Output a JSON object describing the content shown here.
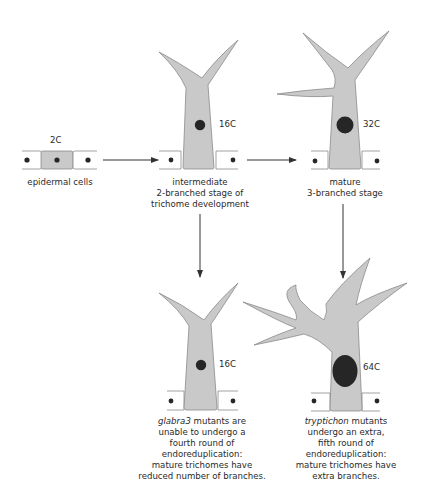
{
  "diagram": {
    "colors": {
      "cell_fill": "#c9c9c9",
      "cell_stroke": "#8a8a8a",
      "epidermal_fill": "#ffffff",
      "nucleus": "#262626",
      "arrow": "#333333"
    },
    "nodes": {
      "epidermal": {
        "ploidy": "2C",
        "caption": "epidermal cells"
      },
      "intermediate": {
        "ploidy": "16C",
        "caption_line1": "intermediate",
        "caption_line2": "2-branched stage of",
        "caption_line3": "trichome development"
      },
      "mature": {
        "ploidy": "32C",
        "caption_line1": "mature",
        "caption_line2": "3-branched stage"
      },
      "glabra3": {
        "ploidy": "16C",
        "caption_italic": "glabra3",
        "caption_line1_rest": " mutants are",
        "caption_line2": "unable to undergo a",
        "caption_line3": "fourth round of",
        "caption_line4": "endoreduplication:",
        "caption_line5": "mature trichomes have",
        "caption_line6": "reduced number of branches."
      },
      "tryptichon": {
        "ploidy": "64C",
        "caption_italic": "tryptichon",
        "caption_line1_rest": " mutants",
        "caption_line2": "undergo an extra,",
        "caption_line3": "fifth round of",
        "caption_line4": "endoreduplication:",
        "caption_line5": "mature trichomes have",
        "caption_line6": "extra branches."
      }
    },
    "edges": [
      {
        "from": "epidermal",
        "to": "intermediate"
      },
      {
        "from": "intermediate",
        "to": "mature"
      },
      {
        "from": "intermediate",
        "to": "glabra3"
      },
      {
        "from": "mature",
        "to": "tryptichon"
      }
    ]
  }
}
